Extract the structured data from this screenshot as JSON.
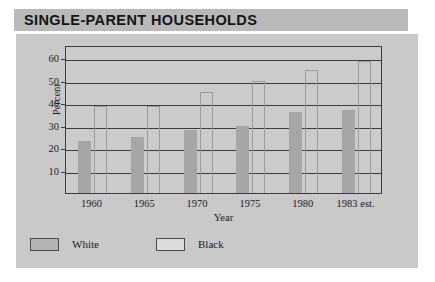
{
  "figure": {
    "title": "SINGLE-PARENT HOUSEHOLDS",
    "axis_label_y": "Percent",
    "axis_label_x": "Year"
  },
  "legend": {
    "position": "below-plot-left",
    "entries": [
      {
        "label": "White",
        "swatch": "filled-gray",
        "color": "#a6a6a6"
      },
      {
        "label": "Black",
        "swatch": "outlined-white",
        "color": "#ffffff"
      }
    ]
  },
  "colors": {
    "title_band": "#b9b9b9",
    "panel": "#c9c9c9",
    "plot_background": "#cbcbcb",
    "axis_line": "#3c3c3c",
    "bar_white_series": "#a6a6a6",
    "bar_black_series_outline": "#9b9b9b",
    "text": "#1d1d1d"
  },
  "chart_data": {
    "type": "bar",
    "title": "SINGLE-PARENT HOUSEHOLDS",
    "xlabel": "Year",
    "ylabel": "Percent",
    "categories": [
      "1960",
      "1965",
      "1970",
      "1975",
      "1980",
      "1983 est."
    ],
    "series": [
      {
        "name": "White",
        "values": [
          23,
          25,
          28,
          30,
          36,
          37
        ]
      },
      {
        "name": "Black",
        "values": [
          39,
          39,
          45,
          50,
          55,
          59
        ]
      }
    ],
    "yticks": [
      10,
      20,
      30,
      40,
      50,
      60
    ],
    "ylim": [
      0,
      66
    ],
    "grid": true,
    "grid_axis": "y",
    "legend_position": "bottom-left"
  }
}
